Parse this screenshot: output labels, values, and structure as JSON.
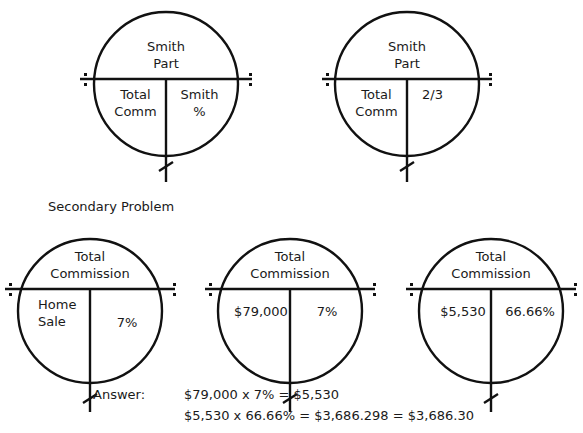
{
  "diagrams": [
    {
      "top": [
        "Smith",
        "Part"
      ],
      "bottom_left": [
        "Total",
        "Comm"
      ],
      "bottom_right": [
        "Smith",
        "%"
      ]
    },
    {
      "top": [
        "Smith",
        "Part"
      ],
      "bottom_left": [
        "Total",
        "Comm"
      ],
      "bottom_right": [
        "2/3"
      ]
    }
  ],
  "secondary": {
    "title": "Secondary Problem",
    "diagrams": [
      {
        "top": [
          "Total",
          "Commission"
        ],
        "bottom_left": [
          "Home",
          "Sale"
        ],
        "bottom_right": [
          "7%"
        ]
      },
      {
        "top": [
          "Total",
          "Commission"
        ],
        "bottom_left": [
          "$79,000"
        ],
        "bottom_right": [
          "7%"
        ]
      },
      {
        "top": [
          "Total",
          "Commission"
        ],
        "bottom_left": [
          "$5,530"
        ],
        "bottom_right": [
          "66.66%"
        ]
      }
    ]
  },
  "answer": {
    "label": "Answer:",
    "lines": [
      "$79,000 x 7% = $5,530",
      "$5,530 x 66.66% = $3,686.298  =  $3,686.30"
    ]
  },
  "colors": {
    "stroke": "#111111",
    "text": "#1a1a1a",
    "background": "#ffffff"
  }
}
